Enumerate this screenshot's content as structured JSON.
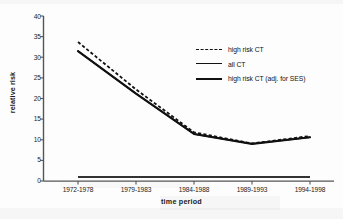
{
  "chart_data": {
    "type": "line",
    "title": "",
    "xlabel": "time period",
    "ylabel": "relative risk",
    "categories": [
      "1972-1978",
      "1979-1983",
      "1984-1988",
      "1989-1993",
      "1994-1998"
    ],
    "ylim": [
      0,
      40
    ],
    "yticks": [
      0,
      5,
      10,
      15,
      20,
      25,
      30,
      35,
      40
    ],
    "grid": false,
    "legend_position": "upper right",
    "series": [
      {
        "name": "high risk CT",
        "style": "dashed",
        "values": [
          33.7,
          22.2,
          11.8,
          9.1,
          10.9
        ]
      },
      {
        "name": "all CT",
        "style": "solid",
        "values": [
          31.5,
          21.2,
          11.4,
          9.0,
          10.6
        ]
      },
      {
        "name": "high risk CT (adj. for SES)",
        "style": "solid-thick",
        "values": [
          31.5,
          21.2,
          11.4,
          9.0,
          10.6
        ]
      }
    ],
    "reference_line": {
      "value": 1.0,
      "style": "solid",
      "label": ""
    },
    "colors": {
      "line": "#111111",
      "axis": "#555555",
      "text": "#1a1a1a",
      "background": "#ffffff"
    }
  }
}
